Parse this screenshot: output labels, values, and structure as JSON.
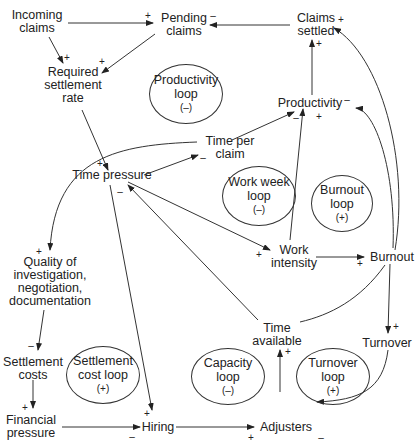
{
  "nodes": {
    "incoming_claims": "Incoming\nclaims",
    "pending_claims": "Pending\nclaims",
    "claims_settled": "Claims\nsettled",
    "required_settlement_rate": "Required\nsettlement\nrate",
    "productivity": "Productivity",
    "time_per_claim": "Time per\nclaim",
    "time_pressure": "Time pressure",
    "work_intensity": "Work\nintensity",
    "burnout": "Burnout",
    "quality": "Quality of\ninvestigation,\nnegotiation,\ndocumentation",
    "settlement_costs": "Settlement\ncosts",
    "financial_pressure": "Financial\npressure",
    "hiring": "Hiring",
    "adjusters": "Adjusters",
    "time_available": "Time\navailable",
    "turnover": "Turnover"
  },
  "loops": [
    {
      "name": "Productivity\nloop",
      "sign": "(–)"
    },
    {
      "name": "Work week\nloop",
      "sign": "(–)"
    },
    {
      "name": "Burnout\nloop",
      "sign": "(+)"
    },
    {
      "name": "Settlement\ncost loop",
      "sign": "(+)"
    },
    {
      "name": "Capacity\nloop",
      "sign": "(–)"
    },
    {
      "name": "Turnover\nloop",
      "sign": "(+)"
    }
  ],
  "links": [
    {
      "from": "Incoming claims",
      "to": "Pending claims",
      "polarity": "+"
    },
    {
      "from": "Incoming claims",
      "to": "Required settlement rate",
      "polarity": "+"
    },
    {
      "from": "Pending claims",
      "to": "Required settlement rate",
      "polarity": "+"
    },
    {
      "from": "Claims settled",
      "to": "Pending claims",
      "polarity": "–"
    },
    {
      "from": "Productivity",
      "to": "Claims settled",
      "polarity": "+"
    },
    {
      "from": "Required settlement rate",
      "to": "Time pressure",
      "polarity": "+"
    },
    {
      "from": "Time pressure",
      "to": "Time per claim",
      "polarity": "–"
    },
    {
      "from": "Time per claim",
      "to": "Productivity",
      "polarity": "–"
    },
    {
      "from": "Time per claim",
      "to": "Quality of investigation",
      "polarity": "+"
    },
    {
      "from": "Time pressure",
      "to": "Work intensity",
      "polarity": "+"
    },
    {
      "from": "Work intensity",
      "to": "Productivity",
      "polarity": "+"
    },
    {
      "from": "Work intensity",
      "to": "Burnout",
      "polarity": "+"
    },
    {
      "from": "Burnout",
      "to": "Productivity",
      "polarity": "–"
    },
    {
      "from": "Burnout",
      "to": "Claims settled",
      "polarity": "+"
    },
    {
      "from": "Burnout",
      "to": "Turnover",
      "polarity": "+"
    },
    {
      "from": "Turnover",
      "to": "Adjusters",
      "polarity": "–"
    },
    {
      "from": "Adjusters",
      "to": "Time available",
      "polarity": "+"
    },
    {
      "from": "Time available",
      "to": "Time pressure",
      "polarity": "–"
    },
    {
      "from": "Time pressure",
      "to": "Hiring",
      "polarity": "+"
    },
    {
      "from": "Quality of investigation",
      "to": "Settlement costs",
      "polarity": "–"
    },
    {
      "from": "Settlement costs",
      "to": "Financial pressure",
      "polarity": "+"
    },
    {
      "from": "Financial pressure",
      "to": "Hiring",
      "polarity": "–"
    },
    {
      "from": "Hiring",
      "to": "Adjusters",
      "polarity": "+"
    }
  ],
  "polarity": {
    "plus": "+",
    "minus": "–"
  }
}
